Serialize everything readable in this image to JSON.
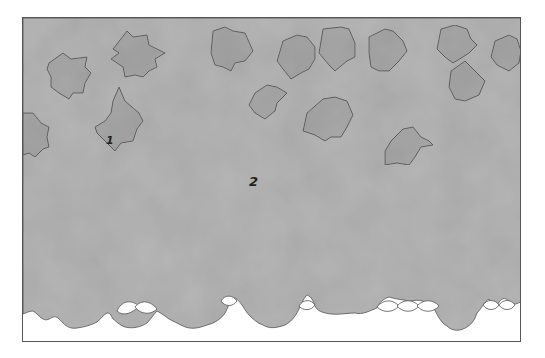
{
  "illustration": {
    "description": "Paint-by-number style coloring page: grey mottled background with holly-leaf shapes and a twisted rope along the bottom",
    "colors": {
      "background": "#ffffff",
      "frame_border": "#555555",
      "region_fill": "#b4b4b4",
      "leaf_fill": "#a9a9a9",
      "outline": "#555555"
    },
    "labels": [
      {
        "id": "region-1",
        "text": "1",
        "x": 108,
        "y": 142
      },
      {
        "id": "region-2",
        "text": "2",
        "x": 250,
        "y": 186
      }
    ]
  }
}
